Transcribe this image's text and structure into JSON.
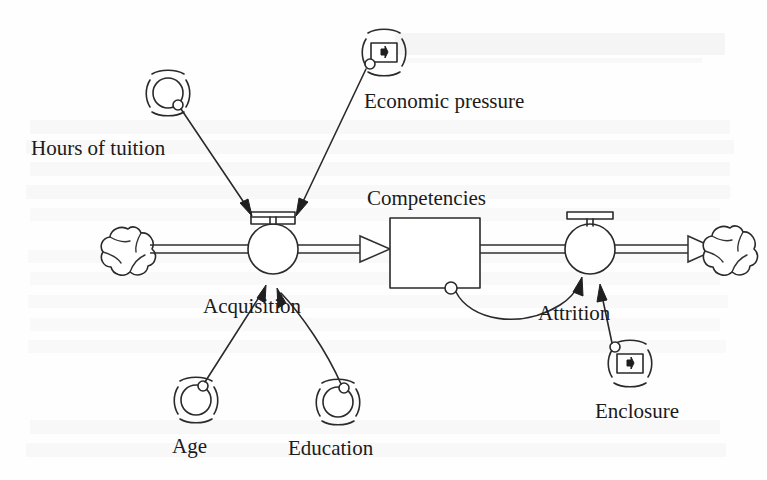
{
  "diagram": {
    "type": "system-dynamics-stock-flow",
    "stock": {
      "name": "Competencies",
      "label": "Competencies",
      "shape": "rectangle"
    },
    "flows": [
      {
        "name": "acquisition",
        "label": "Acquisition",
        "direction": "inflow",
        "source": "cloud-left",
        "target": "Competencies",
        "valve_icon": "valve-handle-icon"
      },
      {
        "name": "attrition",
        "label": "Attrition",
        "direction": "outflow",
        "source": "Competencies",
        "target": "cloud-right",
        "valve_icon": "valve-tap-icon"
      }
    ],
    "clouds": [
      {
        "name": "cloud-left",
        "label": ""
      },
      {
        "name": "cloud-right",
        "label": ""
      }
    ],
    "variables": [
      {
        "name": "hours-of-tuition",
        "label": "Hours of tuition",
        "icon": "circle-in-brackets-icon",
        "influences": "acquisition"
      },
      {
        "name": "economic-pressure",
        "label": "Economic pressure",
        "icon": "boxed-plus-in-brackets-icon",
        "influences": "acquisition"
      },
      {
        "name": "age",
        "label": "Age",
        "icon": "circle-in-brackets-icon",
        "influences": "acquisition"
      },
      {
        "name": "education",
        "label": "Education",
        "icon": "circle-in-brackets-icon",
        "influences": "acquisition"
      },
      {
        "name": "enclosure",
        "label": "Enclosure",
        "icon": "boxed-plus-in-brackets-icon",
        "influences": "attrition"
      }
    ],
    "links": [
      {
        "from": "hours-of-tuition",
        "to": "acquisition",
        "style": "straight"
      },
      {
        "from": "economic-pressure",
        "to": "acquisition",
        "style": "straight"
      },
      {
        "from": "age",
        "to": "acquisition",
        "style": "straight"
      },
      {
        "from": "education",
        "to": "acquisition",
        "style": "curved"
      },
      {
        "from": "Competencies",
        "to": "attrition",
        "style": "curved"
      },
      {
        "from": "enclosure",
        "to": "attrition",
        "style": "straight"
      }
    ],
    "colors": {
      "ink": "#2a2a2a",
      "text": "#1b1b1b",
      "background": "#fefefe",
      "ghost": "#ededed"
    },
    "background_bleed": {
      "visible": true,
      "description": "faint mirrored show-through text from reverse page",
      "line1": "",
      "line2": ""
    }
  }
}
